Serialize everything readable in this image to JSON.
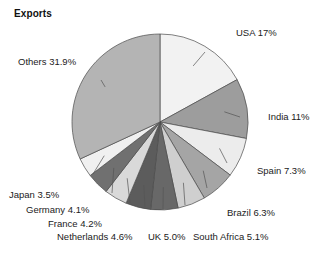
{
  "chart_data": {
    "type": "pie",
    "title": "Exports",
    "subtitle": "",
    "xlabel": "",
    "ylabel": "",
    "legend_position": "callout-labels",
    "grid": false,
    "unit": "%",
    "start_angle_deg": 0,
    "direction": "clockwise",
    "categories": [
      "USA",
      "India",
      "Spain",
      "Brazil",
      "South Africa",
      "UK",
      "Netherlands",
      "France",
      "Germany",
      "Japan",
      "Others"
    ],
    "values": [
      17,
      11,
      7.3,
      6.3,
      5.1,
      5.0,
      4.6,
      4.2,
      4.1,
      3.5,
      31.9
    ],
    "slices": [
      {
        "name": "USA",
        "value": 17,
        "label": "USA 17%",
        "color": "#f2f2f2"
      },
      {
        "name": "India",
        "value": 11,
        "label": "India 11%",
        "color": "#9d9d9d"
      },
      {
        "name": "Spain",
        "value": 7.3,
        "label": "Spain 7.3%",
        "color": "#ececec"
      },
      {
        "name": "Brazil",
        "value": 6.3,
        "label": "Brazil 6.3%",
        "color": "#a5a5a5"
      },
      {
        "name": "South Africa",
        "value": 5.1,
        "label": "South Africa 5.1%",
        "color": "#cfcfcf"
      },
      {
        "name": "UK",
        "value": 5.0,
        "label": "UK 5.0%",
        "color": "#686868"
      },
      {
        "name": "Netherlands",
        "value": 4.6,
        "label": "Netherlands 4.6%",
        "color": "#5c5c5c"
      },
      {
        "name": "France",
        "value": 4.2,
        "label": "France 4.2%",
        "color": "#d9d9d9"
      },
      {
        "name": "Germany",
        "value": 4.1,
        "label": "Germany 4.1%",
        "color": "#707070"
      },
      {
        "name": "Japan",
        "value": 3.5,
        "label": "Japan 3.5%",
        "color": "#f0f0f0"
      },
      {
        "name": "Others",
        "value": 31.9,
        "label": "Others 31.9%",
        "color": "#b4b4b4"
      }
    ],
    "geometry": {
      "center_x": 160,
      "center_y": 122,
      "radius": 88,
      "stroke": "#4a4a4a",
      "stroke_width": 0.7
    },
    "label_positions": [
      {
        "name": "USA",
        "x": 236,
        "y": 28,
        "align": "left",
        "leader_to_x": 205,
        "leader_to_y": 52
      },
      {
        "name": "India",
        "x": 268,
        "y": 112,
        "align": "left",
        "leader_to_x": 240,
        "leader_to_y": 117
      },
      {
        "name": "Spain",
        "x": 257,
        "y": 166,
        "align": "left",
        "leader_to_x": 227,
        "leader_to_y": 163
      },
      {
        "name": "Brazil",
        "x": 227,
        "y": 208,
        "align": "left",
        "leader_to_x": 207,
        "leader_to_y": 188
      },
      {
        "name": "South Africa",
        "x": 193,
        "y": 232,
        "align": "left",
        "leader_to_x": 185,
        "leader_to_y": 205
      },
      {
        "name": "UK",
        "x": 148,
        "y": 232,
        "align": "left",
        "leader_to_x": 163,
        "leader_to_y": 209
      },
      {
        "name": "Netherlands",
        "x": 57,
        "y": 232,
        "align": "left",
        "leader_to_x": 145,
        "leader_to_y": 207
      },
      {
        "name": "France",
        "x": 48,
        "y": 219,
        "align": "left",
        "leader_to_x": 130,
        "leader_to_y": 203
      },
      {
        "name": "Germany",
        "x": 26,
        "y": 205,
        "align": "left",
        "leader_to_x": 112,
        "leader_to_y": 193
      },
      {
        "name": "Japan",
        "x": 9,
        "y": 190,
        "align": "left",
        "leader_to_x": 93,
        "leader_to_y": 174
      },
      {
        "name": "Others",
        "x": 18,
        "y": 57,
        "align": "left",
        "leader_to_x": 101,
        "leader_to_y": 80
      }
    ]
  }
}
